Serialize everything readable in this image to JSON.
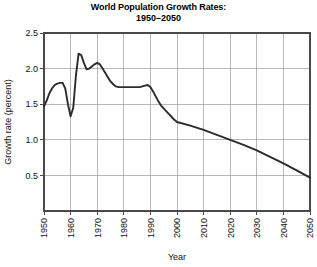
{
  "chart_data": {
    "type": "line",
    "title": "World Population Growth Rates: 1950–2050",
    "title_line1": "World Population Growth Rates:",
    "title_line2": "1950–2050",
    "xlabel": "Year",
    "ylabel": "Growth rate (percent)",
    "xlim": [
      1950,
      2050
    ],
    "ylim": [
      0,
      2.5
    ],
    "xticks": [
      1950,
      1960,
      1970,
      1980,
      1990,
      2000,
      2010,
      2020,
      2030,
      2040,
      2050
    ],
    "xtick_labels": [
      "1950",
      "1960",
      "1970",
      "1980",
      "1990",
      "2000",
      "2010",
      "2020",
      "2030",
      "2040",
      "2050"
    ],
    "yticks": [
      0.5,
      1.0,
      1.5,
      2.0,
      2.5
    ],
    "ytick_labels": [
      "0.5",
      "1.0",
      "1.5",
      "2.0",
      "2.5"
    ],
    "grid": true,
    "legend": false,
    "line_color": "#2b2b2b",
    "series": [
      {
        "name": "World population growth rate",
        "x": [
          1950,
          1951,
          1952,
          1953,
          1954,
          1955,
          1956,
          1957,
          1958,
          1959,
          1960,
          1961,
          1962,
          1963,
          1964,
          1965,
          1966,
          1967,
          1968,
          1969,
          1970,
          1971,
          1972,
          1973,
          1974,
          1975,
          1976,
          1977,
          1978,
          1979,
          1980,
          1981,
          1982,
          1983,
          1984,
          1985,
          1986,
          1987,
          1988,
          1989,
          1990,
          1991,
          1992,
          1993,
          1994,
          1995,
          1996,
          1997,
          1998,
          1999,
          2000,
          2005,
          2010,
          2015,
          2020,
          2025,
          2030,
          2035,
          2040,
          2045,
          2050
        ],
        "values": [
          1.47,
          1.55,
          1.65,
          1.72,
          1.77,
          1.79,
          1.8,
          1.8,
          1.72,
          1.5,
          1.33,
          1.45,
          1.9,
          2.21,
          2.19,
          2.08,
          1.99,
          2.0,
          2.03,
          2.06,
          2.08,
          2.06,
          2.0,
          1.94,
          1.88,
          1.82,
          1.78,
          1.75,
          1.74,
          1.74,
          1.74,
          1.74,
          1.74,
          1.74,
          1.74,
          1.74,
          1.74,
          1.75,
          1.76,
          1.77,
          1.74,
          1.68,
          1.61,
          1.54,
          1.48,
          1.44,
          1.4,
          1.36,
          1.32,
          1.28,
          1.25,
          1.2,
          1.14,
          1.07,
          1.0,
          0.93,
          0.85,
          0.76,
          0.67,
          0.57,
          0.47
        ]
      }
    ]
  },
  "axes": {
    "y_axis_title": "Growth rate (percent)",
    "x_axis_title": "Year"
  }
}
